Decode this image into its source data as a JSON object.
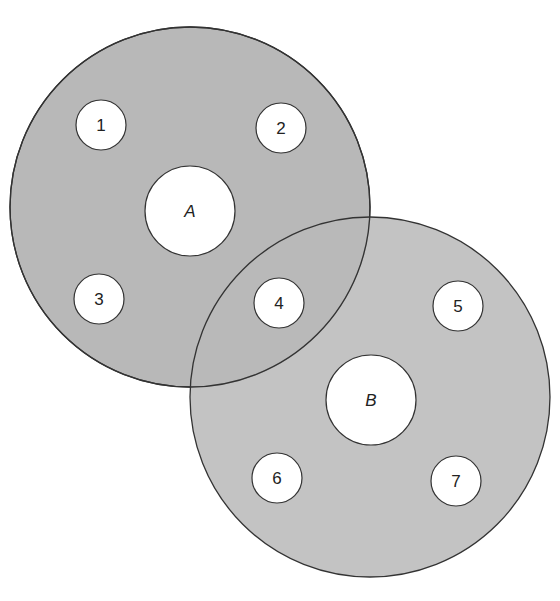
{
  "diagram": {
    "type": "overlapping-regions",
    "colors": {
      "region_fill": "#b8b8b8",
      "stroke": "#333333",
      "node_fill": "#ffffff"
    },
    "regions": [
      {
        "id": "A",
        "label": "A",
        "cx": 190,
        "cy": 207,
        "r": 180,
        "core_r": 45
      },
      {
        "id": "B",
        "label": "B",
        "cx": 370,
        "cy": 397,
        "r": 180,
        "core_r": 45
      }
    ],
    "nodes": [
      {
        "label": "1",
        "cx": 101,
        "cy": 125,
        "r": 25,
        "in": [
          "A"
        ]
      },
      {
        "label": "2",
        "cx": 281,
        "cy": 127,
        "r": 25,
        "in": [
          "A"
        ]
      },
      {
        "label": "3",
        "cx": 99,
        "cy": 299,
        "r": 25,
        "in": [
          "A"
        ]
      },
      {
        "label": "4",
        "cx": 279,
        "cy": 303,
        "r": 25,
        "in": [
          "A",
          "B"
        ]
      },
      {
        "label": "5",
        "cx": 458,
        "cy": 306,
        "r": 25,
        "in": [
          "B"
        ]
      },
      {
        "label": "6",
        "cx": 277,
        "cy": 478,
        "r": 25,
        "in": [
          "B"
        ]
      },
      {
        "label": "7",
        "cx": 456,
        "cy": 481,
        "r": 25,
        "in": [
          "B"
        ]
      }
    ]
  }
}
